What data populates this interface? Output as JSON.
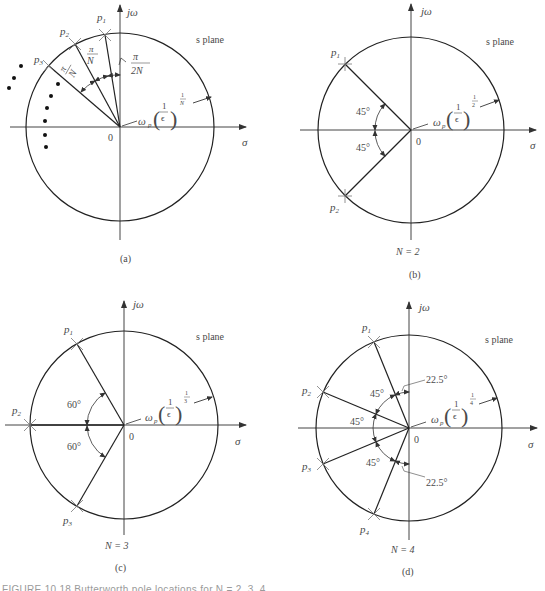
{
  "figure": {
    "axis_labels": {
      "imag": "jω",
      "real": "σ",
      "origin": "0"
    },
    "plane_label": "s plane",
    "radius_label": {
      "omega": "ω",
      "omega_sub": "p",
      "frac_num": "1",
      "frac_den": "ϵ",
      "exp_num": "1"
    },
    "caption_partial": "FIGURE 10.18  Butterworth pole locations for N = 2, 3, 4 ..."
  },
  "panels": [
    {
      "id": "a",
      "tag": "(a)",
      "N_label": "",
      "exponent_den": "N",
      "poles": [
        "p1",
        "p2",
        "p3"
      ],
      "pole_labels": {
        "p1": "p",
        "p1_sub": "1",
        "p2": "p",
        "p2_sub": "2",
        "p3": "p",
        "p3_sub": "3"
      },
      "angle_labels": {
        "first": "π",
        "first_den": "2N",
        "spacing1": "π",
        "spacing1_den": "N",
        "spacing2": "π",
        "spacing2_den": "N"
      },
      "continuation": "• • •"
    },
    {
      "id": "b",
      "tag": "(b)",
      "N_label": "N = 2",
      "exponent_den": "2",
      "poles": [
        "p1",
        "p2"
      ],
      "angle_labels": [
        "45°",
        "45°"
      ]
    },
    {
      "id": "c",
      "tag": "(c)",
      "N_label": "N = 3",
      "exponent_den": "3",
      "poles": [
        "p1",
        "p2",
        "p3"
      ],
      "angle_labels": [
        "60°",
        "60°"
      ]
    },
    {
      "id": "d",
      "tag": "(d)",
      "N_label": "N = 4",
      "exponent_den": "4",
      "poles": [
        "p1",
        "p2",
        "p3",
        "p4"
      ],
      "angle_labels": [
        "45°",
        "45°",
        "45°",
        "22.5°",
        "22.5°"
      ]
    }
  ],
  "text": {
    "p": "p",
    "s1": "1",
    "s2": "2",
    "s3": "3",
    "s4": "4",
    "deg45": "45°",
    "deg60": "60°",
    "deg225": "22.5°",
    "pi": "π",
    "N": "N",
    "twoN": "2N"
  }
}
